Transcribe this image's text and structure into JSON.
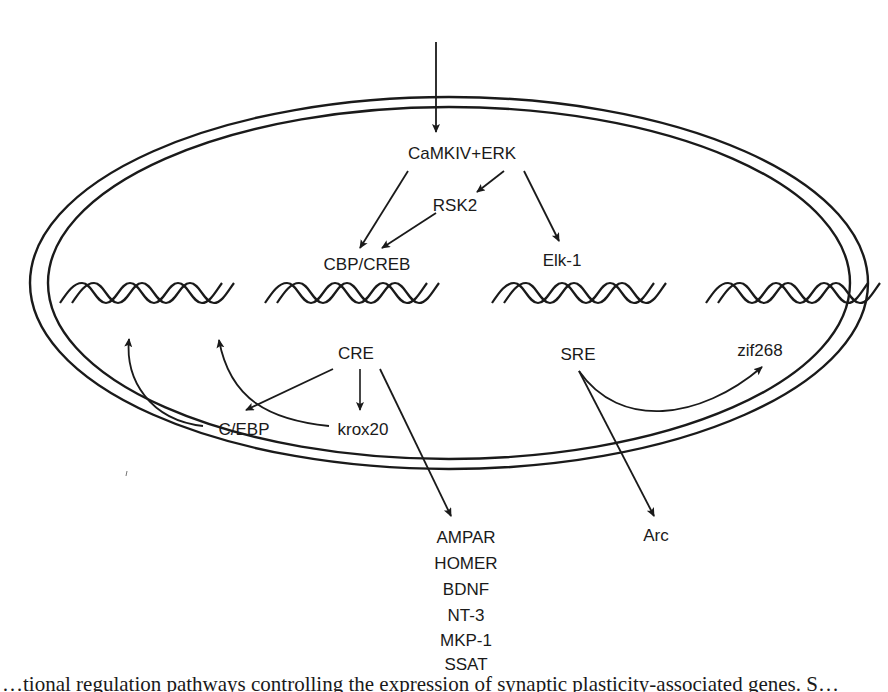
{
  "diagram": {
    "nodes": {
      "camkiv_erk": "CaMKIV+ERK",
      "rsk2": "RSK2",
      "cbp_creb": "CBP/CREB",
      "elk1": "Elk-1",
      "cre": "CRE",
      "sre": "SRE",
      "cebp": "C/EBP",
      "krox20": "krox20",
      "zif268": "zif268",
      "arc": "Arc"
    },
    "cre_targets": [
      "AMPAR",
      "HOMER",
      "BDNF",
      "NT-3",
      "MKP-1",
      "SSAT"
    ],
    "edges": [
      {
        "from": "extracellular",
        "to": "CaMKIV+ERK"
      },
      {
        "from": "CaMKIV+ERK",
        "to": "CBP/CREB"
      },
      {
        "from": "CaMKIV+ERK",
        "to": "RSK2"
      },
      {
        "from": "RSK2",
        "to": "CBP/CREB"
      },
      {
        "from": "CaMKIV+ERK",
        "to": "Elk-1"
      },
      {
        "from": "CRE",
        "to": "C/EBP"
      },
      {
        "from": "CRE",
        "to": "krox20"
      },
      {
        "from": "CRE",
        "to": "AMPAR/HOMER/BDNF/NT-3/MKP-1/SSAT"
      },
      {
        "from": "C/EBP",
        "to": "DNA-1"
      },
      {
        "from": "krox20",
        "to": "DNA-1"
      },
      {
        "from": "SRE",
        "to": "zif268"
      },
      {
        "from": "SRE",
        "to": "Arc"
      }
    ],
    "dna_segments": 4,
    "colors": {
      "stroke": "#1a1a1a",
      "background": "#ffffff"
    }
  },
  "caption": {
    "text": "…tional regulation pathways controlling the expression of synaptic plasticity-associated genes. S…"
  }
}
